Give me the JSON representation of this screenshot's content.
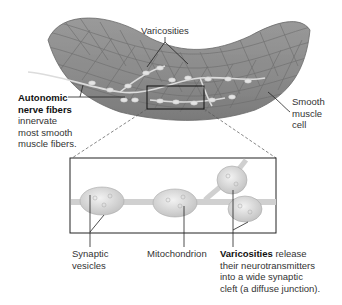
{
  "figure": {
    "top_labels": {
      "varicosities": "Varicosities",
      "autonomic_bold_1": "Autonomic",
      "autonomic_bold_2": "nerve fibers",
      "autonomic_desc_1": "innervate",
      "autonomic_desc_2": "most smooth",
      "autonomic_desc_3": "muscle fibers.",
      "smooth_1": "Smooth",
      "smooth_2": "muscle",
      "smooth_3": "cell"
    },
    "inset_labels": {
      "synaptic_1": "Synaptic",
      "synaptic_2": "vesicles",
      "mitochondrion": "Mitochondrion",
      "varic_bold": "Varicosities",
      "varic_desc_1": " release",
      "varic_desc_2": "their neurotransmitters",
      "varic_desc_3": "into a wide synaptic",
      "varic_desc_4": "cleft (a diffuse junction)."
    },
    "colors": {
      "muscle": "#8f8f8f",
      "muscle_dark": "#6e6e6e",
      "nerve": "#d6d6d6",
      "inset_bg": "#ffffff",
      "leader": "#222222"
    }
  }
}
